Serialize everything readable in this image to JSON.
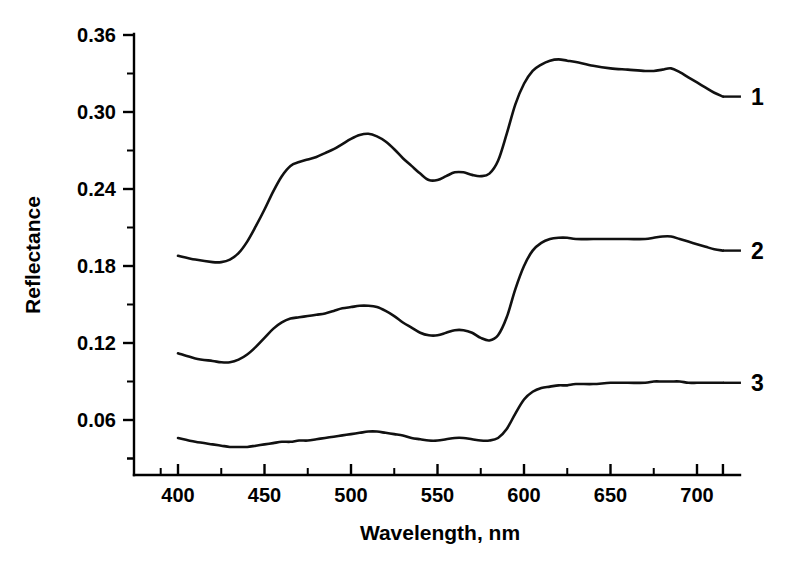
{
  "chart_data": {
    "type": "line",
    "title": "",
    "xlabel": "Wavelength, nm",
    "ylabel": "Reflectance",
    "xlim": [
      385,
      717
    ],
    "ylim": [
      0.0,
      0.375
    ],
    "grid": false,
    "legend_position": "right-inline-curve-labels",
    "x_ticks_major": [
      400,
      450,
      500,
      550,
      600,
      650,
      700
    ],
    "x_ticks_minor": [
      425,
      475,
      525,
      575,
      625,
      675
    ],
    "y_ticks_major": [
      0.06,
      0.12,
      0.18,
      0.24,
      0.3,
      0.36
    ],
    "y_ticks_minor": [
      0.03,
      0.09,
      0.15,
      0.21,
      0.27,
      0.33
    ],
    "y_tick_labels": [
      "0.06",
      "0.12",
      "0.18",
      "0.24",
      "0.30",
      "0.36"
    ],
    "x_tick_labels": [
      "400",
      "450",
      "500",
      "550",
      "600",
      "650",
      "700"
    ],
    "x": [
      400,
      410,
      420,
      425,
      430,
      435,
      440,
      445,
      450,
      455,
      460,
      465,
      470,
      475,
      480,
      485,
      490,
      495,
      500,
      505,
      510,
      515,
      520,
      525,
      530,
      535,
      540,
      545,
      550,
      555,
      560,
      565,
      570,
      575,
      580,
      585,
      590,
      595,
      600,
      605,
      610,
      615,
      620,
      625,
      630,
      640,
      650,
      660,
      670,
      675,
      680,
      685,
      690,
      695,
      700,
      705,
      710,
      715
    ],
    "series": [
      {
        "name": "1",
        "label": "1",
        "values": [
          0.188,
          0.185,
          0.183,
          0.183,
          0.185,
          0.19,
          0.199,
          0.211,
          0.224,
          0.238,
          0.25,
          0.258,
          0.261,
          0.263,
          0.265,
          0.268,
          0.271,
          0.275,
          0.279,
          0.282,
          0.283,
          0.281,
          0.277,
          0.271,
          0.264,
          0.258,
          0.252,
          0.247,
          0.247,
          0.25,
          0.253,
          0.253,
          0.251,
          0.25,
          0.252,
          0.262,
          0.283,
          0.306,
          0.322,
          0.332,
          0.337,
          0.34,
          0.341,
          0.34,
          0.339,
          0.336,
          0.334,
          0.333,
          0.332,
          0.332,
          0.333,
          0.334,
          0.331,
          0.327,
          0.323,
          0.319,
          0.315,
          0.312
        ]
      },
      {
        "name": "2",
        "label": "2",
        "values": [
          0.112,
          0.108,
          0.106,
          0.105,
          0.105,
          0.107,
          0.111,
          0.117,
          0.124,
          0.131,
          0.136,
          0.139,
          0.14,
          0.141,
          0.142,
          0.143,
          0.145,
          0.147,
          0.148,
          0.149,
          0.149,
          0.148,
          0.145,
          0.141,
          0.136,
          0.132,
          0.128,
          0.126,
          0.126,
          0.128,
          0.13,
          0.13,
          0.128,
          0.124,
          0.122,
          0.126,
          0.14,
          0.162,
          0.18,
          0.192,
          0.198,
          0.201,
          0.202,
          0.202,
          0.201,
          0.201,
          0.201,
          0.201,
          0.201,
          0.202,
          0.203,
          0.203,
          0.201,
          0.199,
          0.197,
          0.195,
          0.193,
          0.192
        ]
      },
      {
        "name": "3",
        "label": "3",
        "values": [
          0.046,
          0.043,
          0.041,
          0.04,
          0.039,
          0.039,
          0.039,
          0.04,
          0.041,
          0.042,
          0.043,
          0.043,
          0.044,
          0.044,
          0.045,
          0.046,
          0.047,
          0.048,
          0.049,
          0.05,
          0.051,
          0.051,
          0.05,
          0.049,
          0.048,
          0.046,
          0.045,
          0.044,
          0.044,
          0.045,
          0.046,
          0.046,
          0.045,
          0.044,
          0.044,
          0.046,
          0.053,
          0.065,
          0.076,
          0.082,
          0.085,
          0.086,
          0.087,
          0.087,
          0.088,
          0.088,
          0.089,
          0.089,
          0.089,
          0.09,
          0.09,
          0.09,
          0.09,
          0.089,
          0.089,
          0.089,
          0.089,
          0.089
        ]
      }
    ],
    "curve_label_positions": [
      {
        "label": "1",
        "x": 715,
        "y": 0.312
      },
      {
        "label": "2",
        "x": 715,
        "y": 0.192
      },
      {
        "label": "3",
        "x": 715,
        "y": 0.089
      }
    ]
  },
  "axes": {
    "y_title": "Reflectance",
    "x_title": "Wavelength, nm"
  }
}
